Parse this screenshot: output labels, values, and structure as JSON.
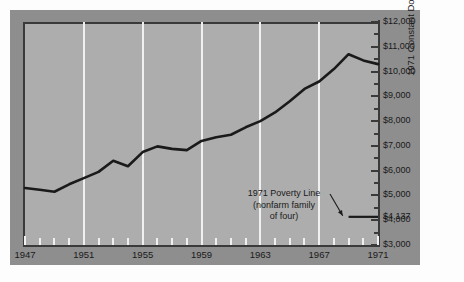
{
  "chart_data": {
    "type": "line",
    "title": "",
    "subtitle": "",
    "xlabel": "",
    "ylabel": "1971 Constant Dollars",
    "xlim": [
      1947,
      1971
    ],
    "ylim": [
      3000,
      12000
    ],
    "grid": "vertical-only",
    "legend": "none",
    "x_ticks_major": [
      1947,
      1951,
      1955,
      1959,
      1963,
      1967,
      1971
    ],
    "x_tick_labels": [
      "1947",
      "1951",
      "1955",
      "1959",
      "1963",
      "1967",
      "1971"
    ],
    "y_ticks_major": [
      3000,
      4000,
      5000,
      6000,
      7000,
      8000,
      9000,
      10000,
      11000,
      12000
    ],
    "y_tick_labels": [
      "$3,000",
      "$4,000",
      "$5,000",
      "$6,000",
      "$7,000",
      "$8,000",
      "$9,000",
      "$10,000",
      "$11,000",
      "$12,000"
    ],
    "series": [
      {
        "name": "Median family income",
        "x": [
          1947,
          1948,
          1949,
          1950,
          1951,
          1952,
          1953,
          1954,
          1955,
          1956,
          1957,
          1958,
          1959,
          1960,
          1961,
          1962,
          1963,
          1964,
          1965,
          1966,
          1967,
          1968,
          1969,
          1970,
          1971
        ],
        "values": [
          5300,
          5230,
          5150,
          5450,
          5700,
          5950,
          6400,
          6180,
          6750,
          6980,
          6880,
          6830,
          7200,
          7350,
          7450,
          7750,
          8000,
          8350,
          8800,
          9300,
          9600,
          10100,
          10700,
          10450,
          10300
        ]
      }
    ],
    "annotations": [
      {
        "name": "poverty-line",
        "label_line1": "1971 Poverty Line",
        "label_line2": "(nonfarm family",
        "label_line3": "of four)",
        "value": 4137,
        "value_label": "$4,137"
      }
    ],
    "colors": {
      "panel": "#adadad",
      "frame": "#8e8e8e",
      "gridline": "#f0f0f0",
      "series_line": "#1a1a1a",
      "axis": "#3a3a3a",
      "text": "#1a1a1a"
    }
  }
}
